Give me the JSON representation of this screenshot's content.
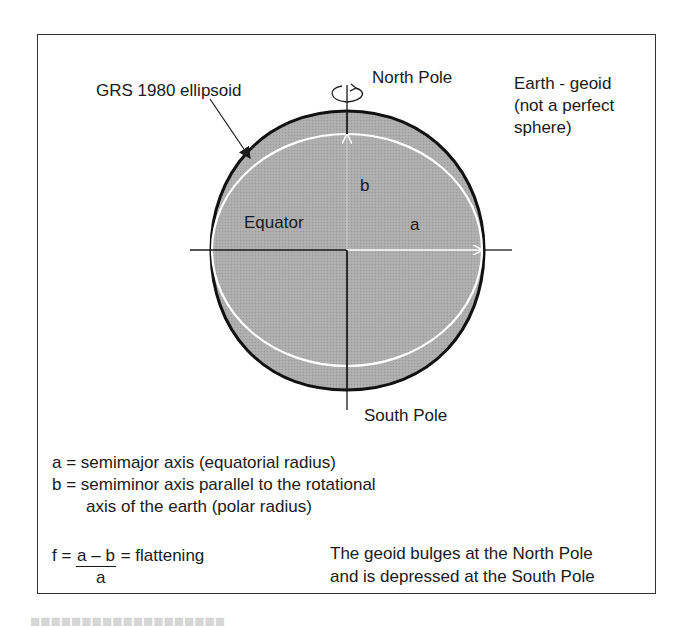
{
  "figure": {
    "labels": {
      "ellipsoid": "GRS 1980 ellipsoid",
      "north_pole": "North Pole",
      "south_pole": "South Pole",
      "geoid_line1": "Earth - geoid",
      "geoid_line2": "(not a perfect",
      "geoid_line3": "sphere)",
      "equator": "Equator",
      "semimajor_symbol": "a",
      "semiminor_symbol": "b"
    },
    "legend": {
      "a_def": "a = semimajor axis (equatorial radius)",
      "b_def_line1": "b = semiminor axis parallel to the rotational",
      "b_def_line2": "axis of the earth (polar radius)"
    },
    "formula": {
      "lhs": "f =",
      "numerator": "a – b",
      "rhs": "= flattening",
      "denominator": "a"
    },
    "note": {
      "line1": "The geoid bulges at the North Pole",
      "line2": "and is depressed at the South Pole"
    },
    "colors": {
      "fill": "#a9a9a9",
      "outline": "#111111",
      "ellipsoid": "#ffffff",
      "axis": "#1a1a1a"
    }
  }
}
